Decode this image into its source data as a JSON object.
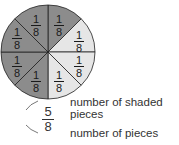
{
  "diagram": {
    "total_pieces": 8,
    "shaded_pieces": 5,
    "colors": {
      "shaded": "#8c8c8c",
      "unshaded": "#e6e6e6",
      "lines": "#222222"
    },
    "pieces": [
      {
        "label_num": "1",
        "label_den": "8",
        "shaded": true
      },
      {
        "label_num": "1",
        "label_den": "8",
        "shaded": false
      },
      {
        "label_num": "1",
        "label_den": "8",
        "shaded": false
      },
      {
        "label_num": "1",
        "label_den": "8",
        "shaded": false
      },
      {
        "label_num": "1",
        "label_den": "8",
        "shaded": true
      },
      {
        "label_num": "1",
        "label_den": "8",
        "shaded": true
      },
      {
        "label_num": "1",
        "label_den": "8",
        "shaded": true
      },
      {
        "label_num": "1",
        "label_den": "8",
        "shaded": true
      }
    ],
    "fraction": {
      "numerator": "5",
      "denominator": "8"
    },
    "annotations": {
      "numerator_label_line1": "number of shaded",
      "numerator_label_line2": "pieces",
      "denominator_label": "number of pieces"
    }
  }
}
